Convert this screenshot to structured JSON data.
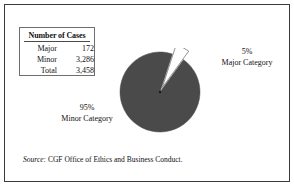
{
  "table": {
    "title": "Number of Cases",
    "rows": [
      {
        "label": "Major",
        "value": "172"
      },
      {
        "label": "Minor",
        "value": "3,286"
      },
      {
        "label": "Total",
        "value": "3,458"
      }
    ]
  },
  "labels": {
    "major_pct": "5%",
    "major_name": "Major Category",
    "minor_pct": "95%",
    "minor_name": "Minor Category"
  },
  "source": {
    "prefix": "Source:",
    "text": "CGF Office of Ethics and Business Conduct."
  },
  "colors": {
    "minor_slice": "#4a4a4a",
    "major_slice": "#ffffff",
    "slice_outline": "#6b6b6b",
    "frame": "#3a3a3a",
    "text": "#111111"
  },
  "chart_data": {
    "type": "pie",
    "title": "Number of Cases",
    "categories": [
      "Minor Category",
      "Major Category"
    ],
    "values": [
      3286,
      172
    ],
    "percentages": [
      95,
      5
    ],
    "counts_total": 3458,
    "colors": [
      "#4a4a4a",
      "#ffffff"
    ],
    "exploded": [
      "Major Category"
    ],
    "start_angle_deg": 18,
    "legend": "none",
    "grid": false,
    "xlabel": "",
    "ylabel": ""
  }
}
